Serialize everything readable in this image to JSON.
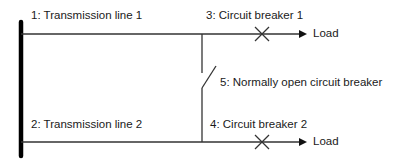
{
  "diagram": {
    "type": "electrical-one-line",
    "labels": {
      "line1": "1: Transmission line 1",
      "line2": "2: Transmission line 2",
      "breaker1": "3: Circuit breaker 1",
      "breaker2": "4: Circuit breaker 2",
      "tie_breaker": "5: Normally open circuit breaker",
      "load_top": "Load",
      "load_bottom": "Load"
    },
    "colors": {
      "line": "#333333",
      "bus": "#000000",
      "text": "#1a1a1a"
    }
  }
}
